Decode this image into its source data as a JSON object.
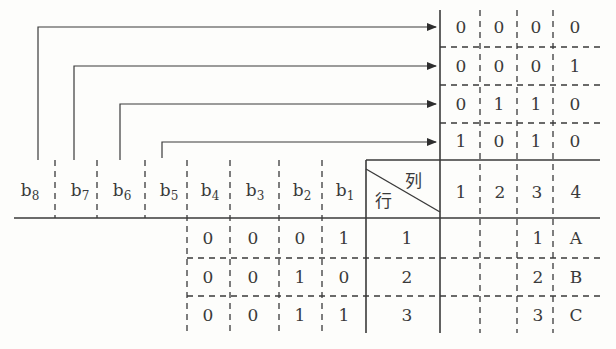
{
  "diagram": {
    "top_grid": {
      "rows": [
        [
          "0",
          "0",
          "0",
          "0"
        ],
        [
          "0",
          "0",
          "0",
          "1"
        ],
        [
          "0",
          "1",
          "1",
          "0"
        ],
        [
          "1",
          "0",
          "1",
          "0"
        ]
      ],
      "arrow_sources": [
        "b8",
        "b7",
        "b6",
        "b5"
      ]
    },
    "header": {
      "bits": [
        {
          "base": "b",
          "sub": "8"
        },
        {
          "base": "b",
          "sub": "7"
        },
        {
          "base": "b",
          "sub": "6"
        },
        {
          "base": "b",
          "sub": "5"
        },
        {
          "base": "b",
          "sub": "4"
        },
        {
          "base": "b",
          "sub": "3"
        },
        {
          "base": "b",
          "sub": "2"
        },
        {
          "base": "b",
          "sub": "1"
        }
      ],
      "corner_col_label": "列",
      "corner_row_label": "行",
      "columns": [
        "1",
        "2",
        "3",
        "4"
      ]
    },
    "data_rows": [
      {
        "bits": [
          "0",
          "0",
          "0",
          "1"
        ],
        "row": "1",
        "col3": "1",
        "col4": "A"
      },
      {
        "bits": [
          "0",
          "0",
          "1",
          "0"
        ],
        "row": "2",
        "col3": "2",
        "col4": "B"
      },
      {
        "bits": [
          "0",
          "0",
          "1",
          "1"
        ],
        "row": "3",
        "col3": "3",
        "col4": "C"
      }
    ],
    "colors": {
      "line": "#3a3a3a",
      "background": "#fdfdfb"
    }
  }
}
